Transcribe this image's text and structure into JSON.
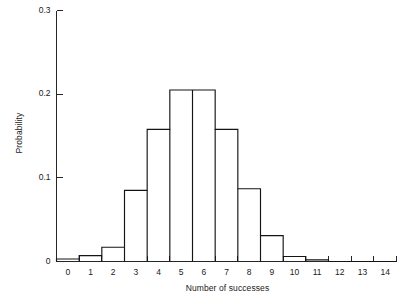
{
  "chart_data": {
    "type": "bar",
    "title": "",
    "subtitle": "",
    "xlabel": "Number of successes",
    "ylabel": "Probability",
    "categories": [
      "0",
      "1",
      "2",
      "3",
      "4",
      "5",
      "6",
      "7",
      "8",
      "9",
      "10",
      "11",
      "12",
      "13",
      "14"
    ],
    "values": [
      0.003,
      0.007,
      0.017,
      0.085,
      0.158,
      0.205,
      0.205,
      0.158,
      0.087,
      0.031,
      0.006,
      0.002,
      0.0,
      0.0,
      0.0
    ],
    "xlim": [
      -0.5,
      14.5
    ],
    "ylim": [
      0,
      0.3
    ],
    "xticks": [
      "0",
      "1",
      "2",
      "3",
      "4",
      "5",
      "6",
      "7",
      "8",
      "9",
      "10",
      "11",
      "12",
      "13",
      "14"
    ],
    "yticks": [
      "0",
      "0.1",
      "0.2",
      "0.3"
    ],
    "ytick_values": [
      0,
      0.1,
      0.2,
      0.3
    ],
    "grid": false,
    "legend": null,
    "bar_style": "step-outline",
    "bar_fill": "#ffffff",
    "bar_stroke": "#141414",
    "axis_color": "#262626",
    "background": "#ffffff",
    "annotations": []
  },
  "axes": {
    "y_title": "Probability",
    "x_title": "Number of successes"
  }
}
